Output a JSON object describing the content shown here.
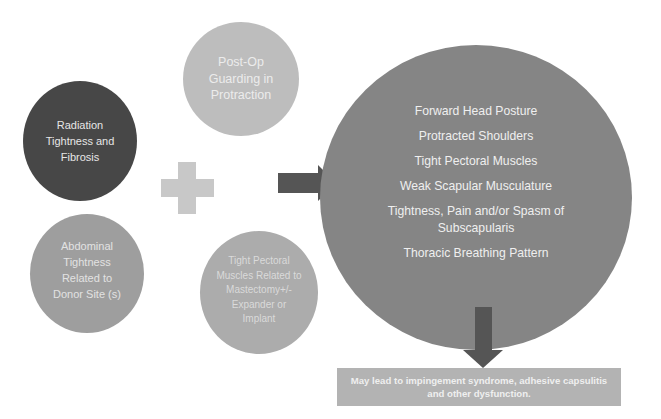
{
  "diagram": {
    "causes": [
      {
        "id": "post-op",
        "label": "Post-Op Guarding in Protraction",
        "color": "#bdbdbd"
      },
      {
        "id": "radiation",
        "label": "Radiation Tightness and Fibrosis",
        "color": "#474747"
      },
      {
        "id": "abdominal",
        "label": "Abdominal Tightness Related to Donor Site (s)",
        "color": "#9e9e9e"
      },
      {
        "id": "pectoral",
        "label": "Tight Pectoral Muscles Related to Mastectomy+/- Expander or Implant",
        "color": "#acacac"
      }
    ],
    "connector_plus": "+",
    "effects": {
      "color": "#858585",
      "items": [
        "Forward Head Posture",
        "Protracted Shoulders",
        "Tight Pectoral Muscles",
        "Weak Scapular Musculature",
        "Tightness, Pain and/or Spasm of Subscapularis",
        "Thoracic Breathing Pattern"
      ]
    },
    "outcome": {
      "label": "May lead to impingement syndrome, adhesive capsulitis and other dysfunction.",
      "color": "#b3b3b3"
    },
    "arrow_color": "#555555"
  }
}
